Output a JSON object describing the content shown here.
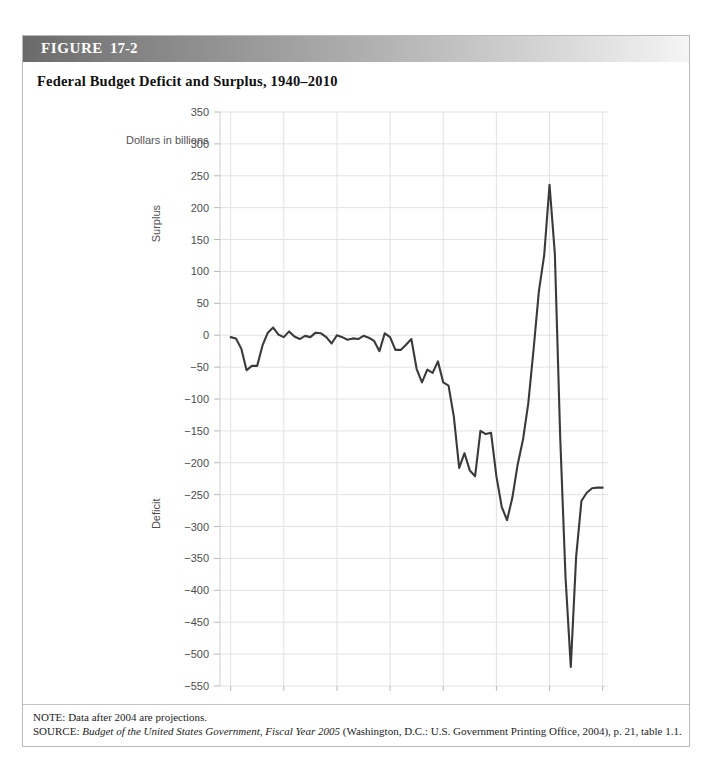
{
  "figure": {
    "label_word": "FIGURE",
    "label_number": "17-2",
    "title": "Federal Budget Deficit and Surplus, 1940–2010"
  },
  "notes": {
    "note_prefix": "NOTE:",
    "note_text": " Data after 2004 are projections.",
    "source_prefix": "SOURCE:",
    "source_italic": "Budget of the United States Government, Fiscal Year 2005",
    "source_rest": " (Washington, D.C.: U.S. Government Printing Office, 2004), p. 21, table 1.1."
  },
  "chart_data": {
    "type": "line",
    "title": "Federal Budget Deficit and Surplus, 1940–2010",
    "unit_label": "Dollars in billions",
    "xlabel": "Year",
    "ylabel_positive": "Surplus",
    "ylabel_negative": "Deficit",
    "xlim": [
      1938,
      2011
    ],
    "ylim": [
      -550,
      350
    ],
    "grid": true,
    "legend": "none",
    "accent_color": "#3a3a3a",
    "gridline_color": "#e2e2e2",
    "yticks": [
      350,
      300,
      250,
      200,
      150,
      100,
      50,
      0,
      -50,
      -100,
      -150,
      -200,
      -250,
      -300,
      -350,
      -400,
      -450,
      -500,
      -550
    ],
    "ytick_labels": [
      "350",
      "300",
      "250",
      "200",
      "150",
      "100",
      "50",
      "0",
      "−50",
      "−100",
      "−150",
      "−200",
      "−250",
      "−300",
      "−350",
      "−400",
      "−450",
      "−500",
      "−550"
    ],
    "xticks": [
      1940,
      1950,
      1960,
      1970,
      1980,
      1990,
      2000,
      2010
    ],
    "xtick_labels": [
      "1940",
      "1950",
      "1960",
      "1970",
      "1980",
      "1990",
      "2000",
      "2010"
    ],
    "x": [
      1940,
      1941,
      1942,
      1943,
      1944,
      1945,
      1946,
      1947,
      1948,
      1949,
      1950,
      1951,
      1952,
      1953,
      1954,
      1955,
      1956,
      1957,
      1958,
      1959,
      1960,
      1961,
      1962,
      1963,
      1964,
      1965,
      1966,
      1967,
      1968,
      1969,
      1970,
      1971,
      1972,
      1973,
      1974,
      1975,
      1976,
      1977,
      1978,
      1979,
      1980,
      1981,
      1982,
      1983,
      1984,
      1985,
      1986,
      1987,
      1988,
      1989,
      1990,
      1991,
      1992,
      1993,
      1994,
      1995,
      1996,
      1997,
      1998,
      1999,
      2000,
      2001,
      2002,
      2003,
      2004,
      2005,
      2006,
      2007,
      2008,
      2009,
      2010
    ],
    "y": [
      -3,
      -5,
      -21,
      -55,
      -48,
      -48,
      -16,
      4,
      12,
      1,
      -3,
      6,
      -2,
      -6,
      -1,
      -3,
      4,
      3,
      -3,
      -13,
      0,
      -3,
      -7,
      -5,
      -6,
      -1,
      -4,
      -9,
      -25,
      3,
      -3,
      -23,
      -23,
      -15,
      -6,
      -53,
      -74,
      -54,
      -59,
      -41,
      -74,
      -79,
      -128,
      -208,
      -185,
      -212,
      -221,
      -150,
      -155,
      -153,
      -221,
      -269,
      -290,
      -255,
      -203,
      -164,
      -107,
      -22,
      69,
      126,
      236,
      128,
      -158,
      -378,
      -520,
      -348,
      -260,
      -247,
      -240,
      -239,
      -239
    ],
    "series_name": "Federal budget surplus/deficit"
  },
  "annotations": {
    "peak_year": 2000,
    "peak_value": 236,
    "trough_year": 2004,
    "trough_value": -520
  }
}
